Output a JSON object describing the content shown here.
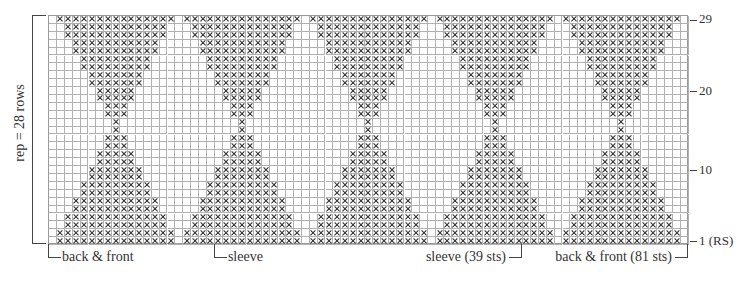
{
  "chart_data": {
    "type": "knitting-chart",
    "title": "",
    "columns": 81,
    "rows": 29,
    "symbol": "x",
    "motif": {
      "period_cols": 16,
      "repeats": 5,
      "first_center_col": 8,
      "row_widths": {
        "1": 15,
        "2": 15,
        "3": 13,
        "4": 13,
        "5": 11,
        "6": 11,
        "7": 9,
        "8": 9,
        "9": 7,
        "10": 7,
        "11": 5,
        "12": 5,
        "13": 3,
        "14": 3,
        "15": 1,
        "16": 1,
        "17": 3,
        "18": 3,
        "19": 5,
        "20": 5,
        "21": 7,
        "22": 7,
        "23": 9,
        "24": 9,
        "25": 11,
        "26": 11,
        "27": 13,
        "28": 13,
        "29": 15
      }
    },
    "row_labels": [
      {
        "row": 29,
        "text": "29"
      },
      {
        "row": 20,
        "text": "20"
      },
      {
        "row": 10,
        "text": "10"
      },
      {
        "row": 1,
        "text": "1 (RS)"
      }
    ],
    "rep_label": "rep = 28 rows",
    "bottom_labels": [
      {
        "text": "back & front",
        "side": "left",
        "col": 0
      },
      {
        "text": "sleeve",
        "side": "left",
        "col": 21
      },
      {
        "text": "sleeve (39 sts)",
        "side": "right",
        "col": 60
      },
      {
        "text": "back & front (81 sts)",
        "side": "right",
        "col": 81
      }
    ],
    "colors": {
      "grid": "#b0b0b0",
      "symbol": "#2a2a2a",
      "background": "#ffffff"
    }
  }
}
